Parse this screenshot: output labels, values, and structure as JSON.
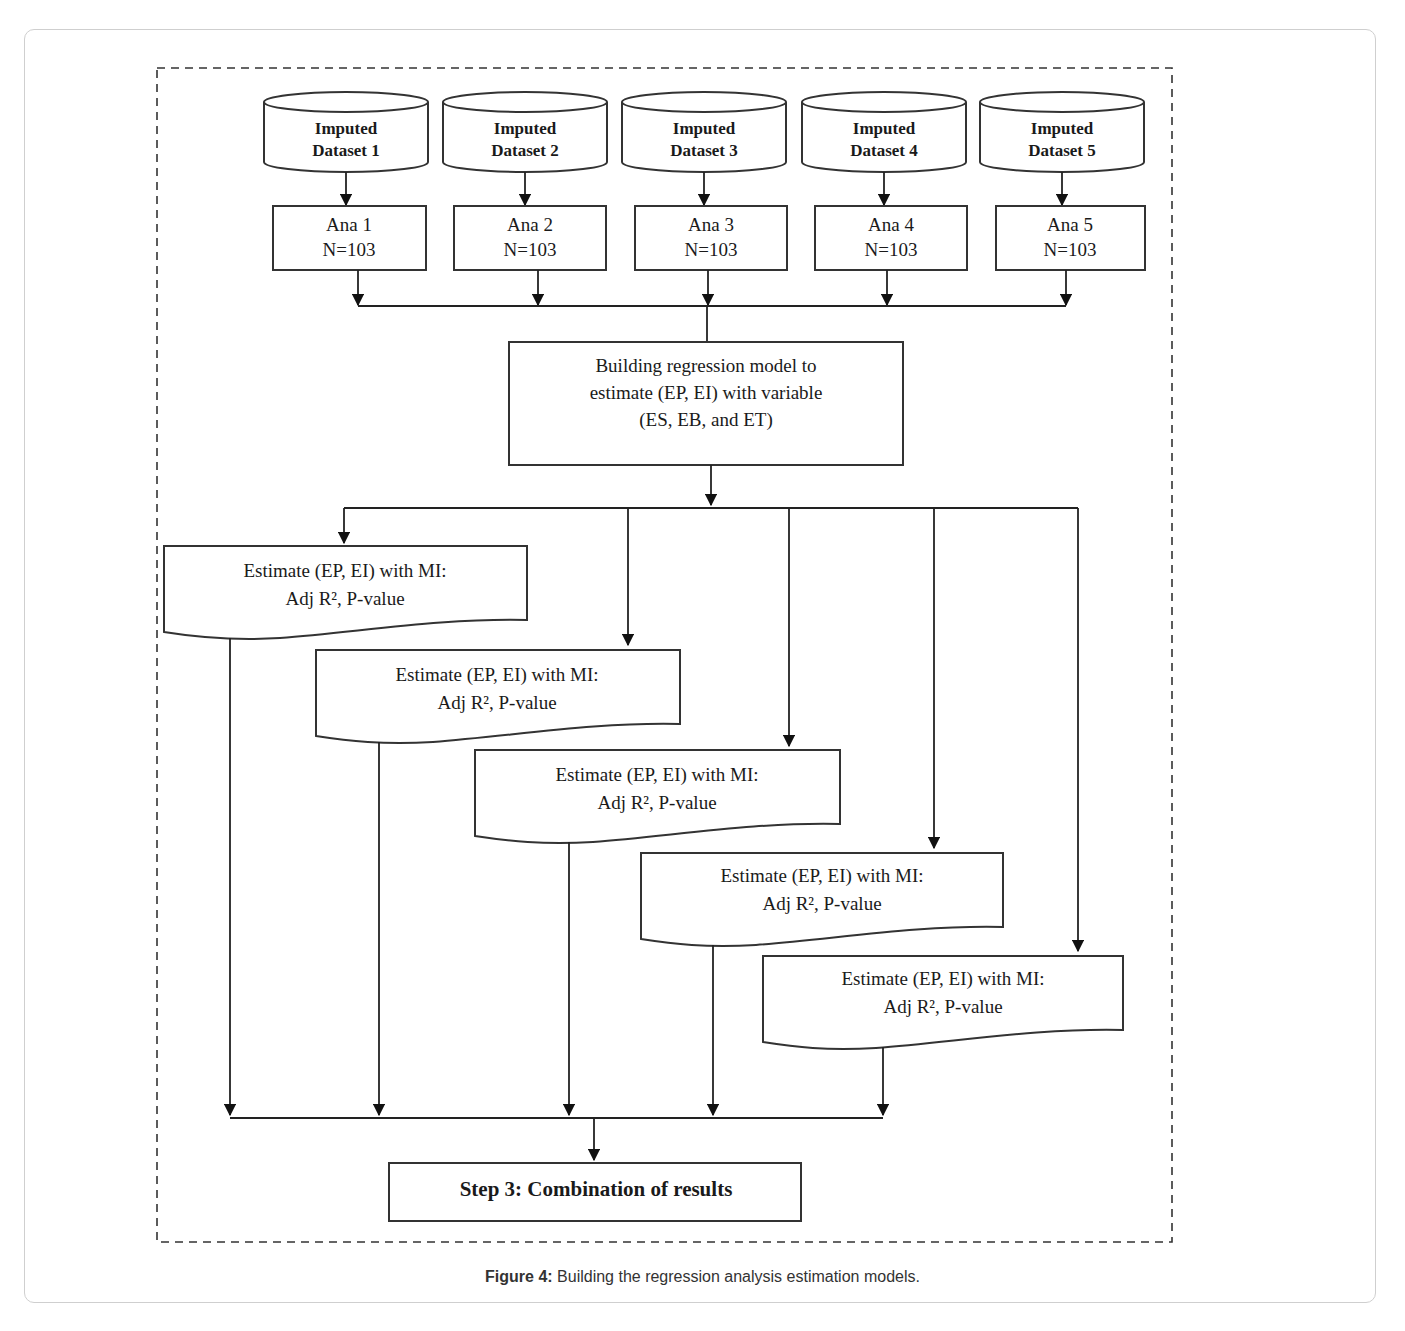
{
  "figure": {
    "caption_label": "Figure 4:",
    "caption_text": " Building the regression analysis estimation models."
  },
  "datasets": [
    {
      "line1": "Imputed",
      "line2": "Dataset 1"
    },
    {
      "line1": "Imputed",
      "line2": "Dataset 2"
    },
    {
      "line1": "Imputed",
      "line2": "Dataset 3"
    },
    {
      "line1": "Imputed",
      "line2": "Dataset 4"
    },
    {
      "line1": "Imputed",
      "line2": "Dataset 5"
    }
  ],
  "analyses": [
    {
      "line1": "Ana 1",
      "line2": "N=103"
    },
    {
      "line1": "Ana 2",
      "line2": "N=103"
    },
    {
      "line1": "Ana 3",
      "line2": "N=103"
    },
    {
      "line1": "Ana 4",
      "line2": "N=103"
    },
    {
      "line1": "Ana 5",
      "line2": "N=103"
    }
  ],
  "model_box": {
    "line1": "Building regression model to",
    "line2": "estimate (EP, EI) with variable",
    "line3": "(ES, EB, and ET)"
  },
  "estimates": [
    {
      "line1": "Estimate (EP, EI) with MI:",
      "line2": "Adj R², P-value"
    },
    {
      "line1": "Estimate (EP, EI) with MI:",
      "line2": "Adj R², P-value"
    },
    {
      "line1": "Estimate (EP, EI) with MI:",
      "line2": "Adj R², P-value"
    },
    {
      "line1": "Estimate (EP, EI) with MI:",
      "line2": "Adj R², P-value"
    },
    {
      "line1": "Estimate (EP, EI) with MI:",
      "line2": "Adj R², P-value"
    }
  ],
  "combination_box": {
    "label": "Step 3: Combination of results"
  }
}
